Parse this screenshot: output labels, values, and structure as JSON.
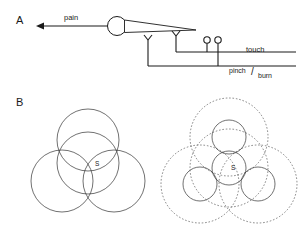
{
  "figure": {
    "panels": [
      {
        "id": "A",
        "label": "A",
        "label_x": 16,
        "label_y": 24,
        "description": "sensory neuron with soma, axon and peripheral receptor endings"
      },
      {
        "id": "B",
        "label": "B",
        "label_x": 16,
        "label_y": 106,
        "description": "overlapping receptive field diagrams"
      }
    ]
  },
  "panel_a": {
    "pain_label": "pain",
    "pain_label_x": 64,
    "pain_label_y": 20,
    "touch_label": "touch",
    "touch_label_x": 246,
    "touch_label_y": 52,
    "pinch_label": "pinch",
    "pinch_label_x": 229,
    "pinch_label_y": 73,
    "slash_label": "/",
    "slash_label_x": 251,
    "slash_label_y": 75,
    "burn_label": "burn",
    "burn_label_x": 258,
    "burn_label_y": 78,
    "soma": {
      "cx": 117,
      "cy": 26,
      "r": 9.5
    },
    "axon_arrow": {
      "x1": 108,
      "y1": 26,
      "x2": 36,
      "y2": 26
    },
    "taper_tip_x": 196,
    "free_endings": [
      {
        "name": "free-nerve-ending-1",
        "x": 148,
        "y": 40,
        "stem_bottom": 66
      },
      {
        "name": "free-nerve-ending-2",
        "x": 176,
        "y": 36,
        "stem_bottom": 52
      }
    ],
    "encapsulated_endings": [
      {
        "name": "encapsulated-ending-1",
        "x": 207,
        "y": 40,
        "r": 3.2,
        "stem_bottom": 52
      },
      {
        "name": "encapsulated-ending-2",
        "x": 218,
        "y": 40,
        "r": 3.2,
        "stem_bottom": 66
      }
    ],
    "touch_line_y": 52,
    "pinch_line_y": 66,
    "line_right_x": 296
  },
  "panel_b_left": {
    "title": "overlapping-receptive-fields-large",
    "center_label": "S",
    "center_label_x": 95,
    "center_label_y": 166,
    "circles": [
      {
        "name": "field-top",
        "cx": 88,
        "cy": 140,
        "r": 31
      },
      {
        "name": "field-center",
        "cx": 88,
        "cy": 163,
        "r": 31
      },
      {
        "name": "field-left",
        "cx": 62,
        "cy": 181,
        "r": 31
      },
      {
        "name": "field-right",
        "cx": 114,
        "cy": 181,
        "r": 31
      }
    ]
  },
  "panel_b_right": {
    "title": "overlapping-receptive-fields-small-with-surround",
    "center_label": "S",
    "center_label_x": 231,
    "center_label_y": 170,
    "solid_circles": [
      {
        "name": "field-top-solid",
        "cx": 229,
        "cy": 137,
        "r": 17
      },
      {
        "name": "field-center-solid",
        "cx": 229,
        "cy": 168,
        "r": 17
      },
      {
        "name": "field-left-solid",
        "cx": 200,
        "cy": 184,
        "r": 17
      },
      {
        "name": "field-right-solid",
        "cx": 258,
        "cy": 184,
        "r": 17
      }
    ],
    "dashed_circles": [
      {
        "name": "surround-top-dashed",
        "cx": 229,
        "cy": 137,
        "r": 39
      },
      {
        "name": "surround-center-dashed",
        "cx": 229,
        "cy": 168,
        "r": 39
      },
      {
        "name": "surround-left-dashed",
        "cx": 200,
        "cy": 184,
        "r": 39
      },
      {
        "name": "surround-right-dashed",
        "cx": 258,
        "cy": 184,
        "r": 39
      }
    ]
  },
  "colors": {
    "ink": "#1a1a1a",
    "circle_solid": "#333333",
    "circle_dashed": "#555555",
    "background": "#ffffff"
  }
}
